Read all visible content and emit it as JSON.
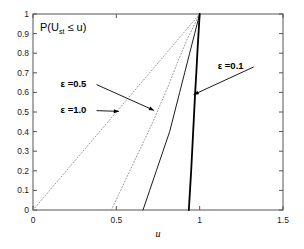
{
  "chart_data": {
    "type": "line",
    "title": "",
    "xlabel": "u",
    "ylabel": "P(U_st <= u)",
    "ylabel_display": "P(U",
    "ylabel_sub": "st",
    "ylabel_tail": " ≤ u)",
    "xlim": [
      0,
      1.5
    ],
    "ylim": [
      0,
      1
    ],
    "grid": false,
    "legend_position": "inline-annotations",
    "xticks": [
      0,
      0.5,
      1,
      1.5
    ],
    "xticklabels": [
      "0",
      "0.5",
      "1",
      "1.5"
    ],
    "yticks": [
      0,
      0.1,
      0.2,
      0.3,
      0.4,
      0.5,
      0.6,
      0.7,
      0.8,
      0.9,
      1
    ],
    "yticklabels": [
      "0",
      "0.1",
      "0.2",
      "0.3",
      "0.4",
      "0.5",
      "0.6",
      "0.7",
      "0.8",
      "0.9",
      "1"
    ],
    "series": [
      {
        "name": "ε =1.0",
        "style": "dotted",
        "color": "#999999",
        "width": 1,
        "x": [
          0.0,
          0.1,
          0.2,
          0.3,
          0.4,
          0.5,
          0.6,
          0.7,
          0.8,
          0.9,
          1.0
        ],
        "values": [
          0.0,
          0.1,
          0.2,
          0.3,
          0.4,
          0.5,
          0.6,
          0.7,
          0.8,
          0.9,
          1.0
        ]
      },
      {
        "name": "ε =0.5",
        "style": "dotted",
        "color": "#999999",
        "width": 1,
        "x": [
          0.47,
          0.52,
          0.57,
          0.62,
          0.67,
          0.72,
          0.77,
          0.82,
          0.87,
          0.93,
          1.0
        ],
        "values": [
          0.0,
          0.09,
          0.18,
          0.27,
          0.36,
          0.45,
          0.55,
          0.65,
          0.76,
          0.88,
          1.0
        ]
      },
      {
        "name": "ε =0.3",
        "style": "solid",
        "color": "#1a1a1a",
        "width": 1,
        "x": [
          0.66,
          0.7,
          0.74,
          0.78,
          0.82,
          0.85,
          0.88,
          0.91,
          0.94,
          0.97,
          1.0
        ],
        "values": [
          0.0,
          0.1,
          0.2,
          0.3,
          0.4,
          0.5,
          0.6,
          0.7,
          0.8,
          0.9,
          1.0
        ]
      },
      {
        "name": "ε =0.1",
        "style": "solid",
        "color": "#000000",
        "width": 1.8,
        "x": [
          0.935,
          0.942,
          0.949,
          0.955,
          0.961,
          0.967,
          0.973,
          0.98,
          0.986,
          0.993,
          1.0
        ],
        "values": [
          0.0,
          0.1,
          0.2,
          0.3,
          0.4,
          0.5,
          0.6,
          0.7,
          0.8,
          0.9,
          1.0
        ]
      }
    ],
    "annotations": [
      {
        "id": "eps-05",
        "text": "ε =0.5",
        "label_x": 0.165,
        "label_y": 0.645,
        "arrow_to_x": 0.735,
        "arrow_to_y": 0.505
      },
      {
        "id": "eps-10",
        "text": "ε =1.0",
        "label_x": 0.165,
        "label_y": 0.512,
        "arrow_to_x": 0.525,
        "arrow_to_y": 0.503
      },
      {
        "id": "eps-01",
        "text": "ε =0.1",
        "label_x": 1.108,
        "label_y": 0.735,
        "arrow_to_x": 0.955,
        "arrow_to_y": 0.585
      }
    ]
  }
}
